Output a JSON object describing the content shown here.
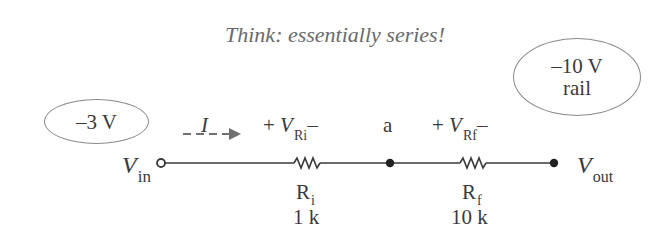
{
  "title": "Think:  essentially series!",
  "callouts": {
    "input_voltage": "–3 V",
    "rail_voltage": "–10 V",
    "rail_label": "rail"
  },
  "circuit": {
    "vin": {
      "symbol": "V",
      "subscript": "in"
    },
    "vout": {
      "symbol": "V",
      "subscript": "out"
    },
    "current": {
      "symbol": "I"
    },
    "node_a": "a",
    "ri": {
      "name": "R",
      "name_sub": "i",
      "value": "1 k",
      "vdrop": {
        "plus": "+",
        "symbol": "V",
        "subscript": "Ri",
        "minus": "–"
      }
    },
    "rf": {
      "name": "R",
      "name_sub": "f",
      "value": "10 k",
      "vdrop": {
        "plus": "+",
        "symbol": "V",
        "subscript": "Rf",
        "minus": "–"
      }
    }
  },
  "colors": {
    "wire": "#3a3a3a",
    "arrow": "#707070",
    "ellipse_border": "#8a8a8a",
    "title": "#6a6a6a"
  }
}
